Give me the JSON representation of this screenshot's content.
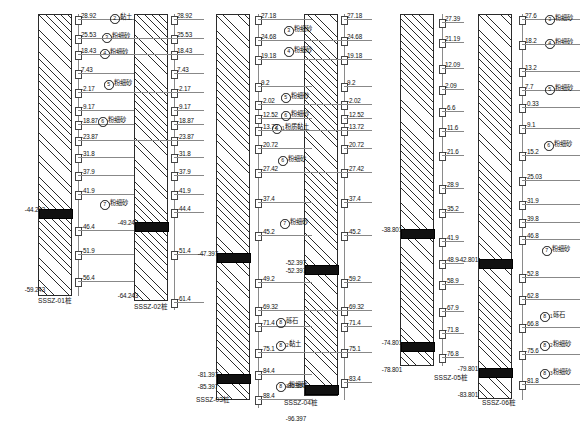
{
  "drawing": {
    "title": "SSSZ Pile Sonic Logging Profile",
    "units": "m",
    "layer_names": {
      "clay": "黏土",
      "silty_fine_sand": "粉细砂",
      "silty_clay": "粉质黏土",
      "gravel": "砾石",
      "pile_suffix": "桩"
    }
  },
  "piles": [
    {
      "id": "p1",
      "caption": "SSSZ-01桩",
      "band_top_value": "-44.243",
      "band_bottom_value": "",
      "toe_value": "-59.243",
      "axis_left": {
        "values": [
          "28.92",
          "25.53",
          "18.43",
          "7.43",
          "-2.17",
          "-9.17",
          "-18.87",
          "-23.87",
          "-31.8",
          "-37.9",
          "-41.9",
          "-46.4",
          "-51.9",
          "-56.4"
        ]
      },
      "layers": [
        {
          "num": "2",
          "name": "黏土",
          "sub": ""
        },
        {
          "num": "3",
          "name": "粉细砂",
          "sub": ""
        },
        {
          "num": "4",
          "name": "粉细砂",
          "sub": ""
        },
        {
          "num": "5",
          "name": "粉细砂",
          "sub": ""
        },
        {
          "num": "6",
          "name": "粉细砂",
          "sub": ""
        },
        {
          "num": "7",
          "name": "粉细砂",
          "sub": ""
        }
      ]
    },
    {
      "id": "p2",
      "caption": "SSSZ-02桩",
      "band_top_value": "-49.243",
      "toe_value": "-64.243",
      "axis_right": {
        "values": [
          "28.92",
          "25.53",
          "18.43",
          "7.43",
          "-2.17",
          "-9.17",
          "-18.87",
          "-23.87",
          "-31.8",
          "-37.9",
          "-41.9",
          "-44.4",
          "-51.4",
          "-61.4"
        ]
      }
    },
    {
      "id": "p3",
      "caption": "SSSZ-03桩",
      "band_top_value": "-47.397",
      "band2_top_value": "-81.397",
      "band2_bottom_value": "-85.397",
      "axis_left": {
        "values": [
          "27.18",
          "24.68",
          "19.18",
          "9.2",
          "-2.02",
          "-12.52",
          "-13.72",
          "-20.72",
          "-27.42",
          "-37.4",
          "-45.2",
          "-49.2",
          "-69.32",
          "-71.4",
          "-75.1",
          "-84.4",
          "-88.4"
        ]
      },
      "axis_right": {
        "values": [
          "27.18",
          "24.68",
          "19.18",
          "9.2",
          "-2.02",
          "-12.52",
          "-13.72",
          "-20.72",
          "-27.42",
          "-37.4",
          "-45.2",
          "-59.2",
          "-69.32",
          "-71.4",
          "-75.1",
          "-83.4"
        ]
      },
      "layers": [
        {
          "num": "3",
          "name": "粉细砂",
          "sub": ""
        },
        {
          "num": "4",
          "name": "粉细砂",
          "sub": ""
        },
        {
          "num": "5",
          "name": "粉细砂",
          "sub": ""
        },
        {
          "num": "6",
          "name": "粉细砂",
          "sub": ""
        },
        {
          "num": "6",
          "name": "粉质黏土",
          "sub": "1"
        },
        {
          "num": "6",
          "name": "粉细砂",
          "sub": ""
        },
        {
          "num": "7",
          "name": "粉细砂",
          "sub": ""
        },
        {
          "num": "8",
          "name": "砾石",
          "sub": ""
        },
        {
          "num": "8",
          "name": "黏土",
          "sub": "2"
        },
        {
          "num": "8",
          "name": "粉细砂",
          "sub": "3"
        }
      ]
    },
    {
      "id": "p4",
      "caption": "SSSZ-04桩",
      "band_top_value": "-52.397",
      "band_top_value2": "-52.397",
      "band2_top_value": "-86.397",
      "toe_value": "-96.397"
    },
    {
      "id": "p5",
      "caption": "SSSZ-05桩",
      "band_top_value": "-38.801",
      "band2_top_value": "-74.801",
      "toe_value": "-78.801",
      "axis_right": {
        "values": [
          "27.39",
          "21.19",
          "12.09",
          "2.09",
          "-6.6",
          "-11.6",
          "-21.6",
          "-28.9",
          "-35.2",
          "-41.9",
          "-48.9",
          "-58.9",
          "-67.9",
          "-71.8",
          "-76.8"
        ]
      }
    },
    {
      "id": "p6",
      "caption": "SSSZ-06桩",
      "band_top_value": "-42.801",
      "band2_top_value": "-79.801",
      "toe_value": "-83.801",
      "axis_right": {
        "values": [
          "27.6",
          "18.2",
          "13.2",
          "7.7",
          "-0.33",
          "-9.1",
          "-15.2",
          "-25.03",
          "-31.9",
          "-39.8",
          "-46.8",
          "-52.8",
          "-62.8",
          "-66.8",
          "-75.6",
          "-81.8"
        ]
      },
      "layers": [
        {
          "num": "3",
          "name": "粉细砂",
          "sub": ""
        },
        {
          "num": "4",
          "name": "粉细砂",
          "sub": ""
        },
        {
          "num": "5",
          "name": "粉细砂",
          "sub": ""
        },
        {
          "num": "6",
          "name": "粉细砂",
          "sub": ""
        },
        {
          "num": "7",
          "name": "粉细砂",
          "sub": ""
        },
        {
          "num": "8",
          "name": "砾石",
          "sub": "1"
        },
        {
          "num": "8",
          "name": "粉细砂",
          "sub": "2"
        },
        {
          "num": "8",
          "name": "粉细砂",
          "sub": "3"
        }
      ]
    }
  ],
  "axis_rows": {
    "g1_left": [
      {
        "v": "28.92",
        "y": 19
      },
      {
        "v": "25.53",
        "y": 38
      },
      {
        "v": "18.43",
        "y": 54
      },
      {
        "v": "7.43",
        "y": 73
      },
      {
        "v": "-2.17",
        "y": 92
      },
      {
        "v": "-9.17",
        "y": 110
      },
      {
        "v": "-18.87",
        "y": 124
      },
      {
        "v": "-23.87",
        "y": 140
      },
      {
        "v": "-31.8",
        "y": 157
      },
      {
        "v": "-37.9",
        "y": 175
      },
      {
        "v": "-41.9",
        "y": 194
      },
      {
        "v": "-46.4",
        "y": 230
      },
      {
        "v": "-51.9",
        "y": 254
      },
      {
        "v": "-56.4",
        "y": 281
      }
    ],
    "g1_right": [
      {
        "v": "28.92",
        "y": 19
      },
      {
        "v": "25.53",
        "y": 38
      },
      {
        "v": "18.43",
        "y": 54
      },
      {
        "v": "7.43",
        "y": 73
      },
      {
        "v": "-2.17",
        "y": 92
      },
      {
        "v": "-9.17",
        "y": 110
      },
      {
        "v": "-18.87",
        "y": 124
      },
      {
        "v": "-23.87",
        "y": 140
      },
      {
        "v": "-31.8",
        "y": 157
      },
      {
        "v": "-37.9",
        "y": 175
      },
      {
        "v": "-41.9",
        "y": 194
      },
      {
        "v": "-44.4",
        "y": 212
      },
      {
        "v": "-51.4",
        "y": 254
      },
      {
        "v": "-61.4",
        "y": 302
      }
    ],
    "g2_left": [
      {
        "v": "27.18",
        "y": 19
      },
      {
        "v": "24.68",
        "y": 40
      },
      {
        "v": "19.18",
        "y": 59
      },
      {
        "v": "9.2",
        "y": 86
      },
      {
        "v": "-2.02",
        "y": 104
      },
      {
        "v": "-12.52",
        "y": 118
      },
      {
        "v": "-13.72",
        "y": 130
      },
      {
        "v": "-20.72",
        "y": 148
      },
      {
        "v": "-27.42",
        "y": 172
      },
      {
        "v": "-37.4",
        "y": 202
      },
      {
        "v": "-45.2",
        "y": 235
      },
      {
        "v": "-49.2",
        "y": 282
      },
      {
        "v": "-69.32",
        "y": 310
      },
      {
        "v": "-71.4",
        "y": 326
      },
      {
        "v": "-75.1",
        "y": 352
      },
      {
        "v": "-84.4",
        "y": 374
      },
      {
        "v": "-88.4",
        "y": 399
      }
    ],
    "g2_right": [
      {
        "v": "27.18",
        "y": 19
      },
      {
        "v": "24.68",
        "y": 40
      },
      {
        "v": "19.18",
        "y": 59
      },
      {
        "v": "9.2",
        "y": 86
      },
      {
        "v": "-2.02",
        "y": 104
      },
      {
        "v": "-12.52",
        "y": 118
      },
      {
        "v": "-13.72",
        "y": 130
      },
      {
        "v": "-20.72",
        "y": 148
      },
      {
        "v": "-27.42",
        "y": 172
      },
      {
        "v": "-37.4",
        "y": 202
      },
      {
        "v": "-45.2",
        "y": 235
      },
      {
        "v": "-59.2",
        "y": 282
      },
      {
        "v": "-69.32",
        "y": 310
      },
      {
        "v": "-71.4",
        "y": 326
      },
      {
        "v": "-75.1",
        "y": 352
      },
      {
        "v": "-83.4",
        "y": 382
      }
    ],
    "g3_left": [
      {
        "v": "27.39",
        "y": 22
      },
      {
        "v": "21.19",
        "y": 42
      },
      {
        "v": "12.09",
        "y": 68
      },
      {
        "v": "2.09",
        "y": 89
      },
      {
        "v": "-6.6",
        "y": 111
      },
      {
        "v": "-11.6",
        "y": 131
      },
      {
        "v": "-21.6",
        "y": 155
      },
      {
        "v": "-28.9",
        "y": 188
      },
      {
        "v": "-35.2",
        "y": 212
      },
      {
        "v": "-41.9",
        "y": 241
      },
      {
        "v": "-48.9",
        "y": 263
      },
      {
        "v": "-58.9",
        "y": 284
      },
      {
        "v": "-67.9",
        "y": 311
      },
      {
        "v": "-71.8",
        "y": 333
      },
      {
        "v": "-76.8",
        "y": 357
      }
    ],
    "g3_right": [
      {
        "v": "27.6",
        "y": 19
      },
      {
        "v": "18.2",
        "y": 44
      },
      {
        "v": "13.2",
        "y": 71
      },
      {
        "v": "7.7",
        "y": 90
      },
      {
        "v": "-0.33",
        "y": 107
      },
      {
        "v": "-9.1",
        "y": 128
      },
      {
        "v": "-15.2",
        "y": 155
      },
      {
        "v": "-25.03",
        "y": 180
      },
      {
        "v": "-31.9",
        "y": 204
      },
      {
        "v": "-39.8",
        "y": 222
      },
      {
        "v": "-46.8",
        "y": 239
      },
      {
        "v": "-52.8",
        "y": 277
      },
      {
        "v": "-62.8",
        "y": 299
      },
      {
        "v": "-66.8",
        "y": 327
      },
      {
        "v": "-75.6",
        "y": 354
      },
      {
        "v": "-81.8",
        "y": 384
      }
    ]
  }
}
